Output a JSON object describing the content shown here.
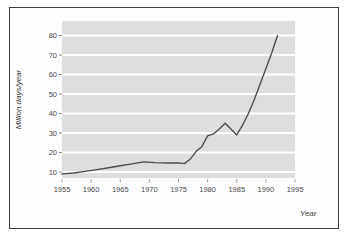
{
  "figure": {
    "border_color": "#3c3c3c",
    "background": "#ffffff",
    "plot_background": "#dedede",
    "gridline_color": "#ffffff",
    "line_color": "#4a4a4a"
  },
  "labels": {
    "ylabel": "Million days/year",
    "xlabel": "Year"
  },
  "chart_data": {
    "type": "line",
    "title": "",
    "xlabel": "Year",
    "ylabel": "Million days/year",
    "xlim": [
      1955,
      1995
    ],
    "ylim": [
      0,
      85
    ],
    "xticks": [
      1955,
      1960,
      1965,
      1970,
      1975,
      1980,
      1985,
      1990,
      1995
    ],
    "xtick_labels": [
      "1955",
      "1960",
      "1965",
      "1970",
      "1975",
      "1980",
      "1985",
      "1990",
      "1995"
    ],
    "yticks": [
      10,
      20,
      30,
      40,
      50,
      60,
      70,
      80
    ],
    "ytick_labels": [
      "10",
      "20",
      "30",
      "40",
      "50",
      "60",
      "70",
      "80"
    ],
    "grid": "horizontal",
    "legend": "none",
    "series": [
      {
        "name": "Million days/year",
        "color": "#4a4a4a",
        "x": [
          1955,
          1957,
          1959,
          1961,
          1963,
          1965,
          1967,
          1969,
          1971,
          1973,
          1975,
          1976,
          1977,
          1978,
          1979,
          1980,
          1981,
          1982,
          1983,
          1984,
          1985,
          1986,
          1987,
          1988,
          1989,
          1990,
          1991,
          1992
        ],
        "y": [
          9,
          9.5,
          10.3,
          11.2,
          12.2,
          13.2,
          14.2,
          15.2,
          14.8,
          14.6,
          14.7,
          14.3,
          16.5,
          20.5,
          23,
          28.5,
          29.5,
          32,
          35,
          32,
          29,
          34,
          40,
          47,
          55,
          63,
          71,
          80
        ]
      }
    ]
  }
}
